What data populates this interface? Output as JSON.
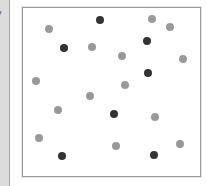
{
  "side_panel": {
    "fragment_text": "y"
  },
  "colors": {
    "dark": "#333333",
    "light": "#999999",
    "frame": "#9a9a9a"
  },
  "chart_data": {
    "type": "scatter",
    "title": "",
    "xlabel": "",
    "ylabel": "",
    "grid": false,
    "legend": null,
    "xlim": [
      22,
      200
    ],
    "ylim": [
      7,
      176
    ],
    "series": [
      {
        "name": "dark",
        "color": "#333333",
        "points": [
          [
            100,
            20
          ],
          [
            64,
            48
          ],
          [
            147,
            41
          ],
          [
            148,
            73
          ],
          [
            114,
            114
          ],
          [
            62,
            156
          ],
          [
            154,
            155
          ]
        ]
      },
      {
        "name": "light",
        "color": "#999999",
        "points": [
          [
            49,
            29
          ],
          [
            92,
            47
          ],
          [
            36,
            81
          ],
          [
            152,
            19
          ],
          [
            170,
            27
          ],
          [
            122,
            56
          ],
          [
            183,
            59
          ],
          [
            125,
            85
          ],
          [
            90,
            96
          ],
          [
            58,
            110
          ],
          [
            155,
            117
          ],
          [
            39,
            138
          ],
          [
            116,
            146
          ],
          [
            180,
            144
          ]
        ]
      }
    ]
  }
}
